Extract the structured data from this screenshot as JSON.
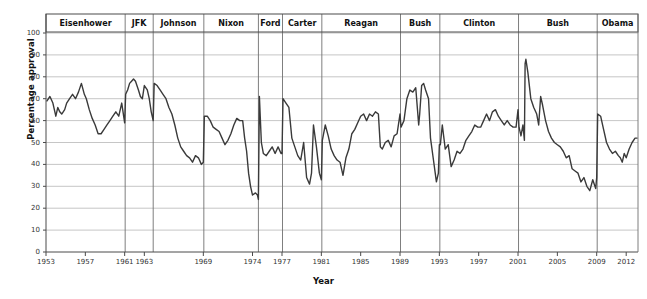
{
  "chart_data": {
    "type": "line",
    "title": "",
    "xlabel": "Year",
    "ylabel": "Percentage approval",
    "xlim": [
      1953,
      2013.2
    ],
    "ylim": [
      0,
      100
    ],
    "grid": true,
    "legend": "none",
    "line_color": "#3a3a3a",
    "grid_color": "#b8b8b8",
    "axis_color": "#555555",
    "yticks": [
      0,
      10,
      20,
      30,
      40,
      50,
      60,
      70,
      80,
      90,
      100
    ],
    "xticks": [
      1953,
      1957,
      1961,
      1963,
      1969,
      1974,
      1977,
      1981,
      1985,
      1989,
      1993,
      1997,
      2001,
      2005,
      2009,
      2012
    ],
    "series": [
      {
        "name": "Presidential approval",
        "x": [
          1953.1,
          1953.4,
          1953.7,
          1954.0,
          1954.2,
          1954.4,
          1954.6,
          1954.9,
          1955.1,
          1955.4,
          1955.7,
          1956.0,
          1956.3,
          1956.6,
          1956.9,
          1957.1,
          1957.4,
          1957.7,
          1958.0,
          1958.3,
          1958.6,
          1958.9,
          1959.2,
          1959.5,
          1959.8,
          1960.1,
          1960.4,
          1960.7,
          1961.0,
          1961.1,
          1961.3,
          1961.5,
          1961.7,
          1961.9,
          1962.1,
          1962.4,
          1962.6,
          1962.8,
          1963.0,
          1963.3,
          1963.5,
          1963.7,
          1963.9,
          1964.0,
          1964.3,
          1964.6,
          1964.9,
          1965.2,
          1965.5,
          1965.8,
          1966.1,
          1966.4,
          1966.7,
          1967.0,
          1967.3,
          1967.6,
          1967.9,
          1968.2,
          1968.5,
          1968.8,
          1969.0,
          1969.1,
          1969.4,
          1969.7,
          1970.0,
          1970.3,
          1970.6,
          1970.9,
          1971.2,
          1971.5,
          1971.8,
          1972.1,
          1972.4,
          1972.7,
          1973.0,
          1973.2,
          1973.4,
          1973.6,
          1973.8,
          1974.0,
          1974.3,
          1974.5,
          1974.6,
          1974.7,
          1974.9,
          1975.1,
          1975.4,
          1975.7,
          1976.0,
          1976.3,
          1976.6,
          1976.9,
          1977.0,
          1977.1,
          1977.4,
          1977.7,
          1978.0,
          1978.3,
          1978.6,
          1978.9,
          1979.2,
          1979.5,
          1979.8,
          1980.0,
          1980.2,
          1980.5,
          1980.8,
          1981.0,
          1981.1,
          1981.4,
          1981.7,
          1982.0,
          1982.3,
          1982.6,
          1982.9,
          1983.2,
          1983.5,
          1983.8,
          1984.1,
          1984.4,
          1984.7,
          1985.0,
          1985.3,
          1985.6,
          1985.9,
          1986.2,
          1986.5,
          1986.8,
          1987.0,
          1987.2,
          1987.5,
          1987.8,
          1988.1,
          1988.4,
          1988.7,
          1989.0,
          1989.1,
          1989.4,
          1989.7,
          1990.0,
          1990.3,
          1990.6,
          1990.9,
          1991.0,
          1991.2,
          1991.4,
          1991.6,
          1991.9,
          1992.1,
          1992.4,
          1992.7,
          1992.9,
          1993.0,
          1993.1,
          1993.3,
          1993.6,
          1993.9,
          1994.2,
          1994.5,
          1994.8,
          1995.1,
          1995.4,
          1995.7,
          1996.0,
          1996.3,
          1996.6,
          1996.9,
          1997.2,
          1997.5,
          1997.8,
          1998.1,
          1998.4,
          1998.7,
          1999.0,
          1999.3,
          1999.6,
          1999.9,
          2000.2,
          2000.5,
          2000.8,
          2001.0,
          2001.1,
          2001.3,
          2001.5,
          2001.65,
          2001.72,
          2001.8,
          2002.0,
          2002.3,
          2002.6,
          2002.9,
          2003.1,
          2003.3,
          2003.5,
          2003.8,
          2004.1,
          2004.4,
          2004.7,
          2005.0,
          2005.3,
          2005.6,
          2005.9,
          2006.2,
          2006.5,
          2006.8,
          2007.1,
          2007.4,
          2007.7,
          2008.0,
          2008.3,
          2008.6,
          2008.9,
          2009.0,
          2009.1,
          2009.4,
          2009.7,
          2010.0,
          2010.3,
          2010.6,
          2010.9,
          2011.2,
          2011.4,
          2011.6,
          2011.8,
          2012.0,
          2012.3,
          2012.6,
          2012.9,
          2013.1
        ],
        "values": [
          69,
          71,
          68,
          62,
          66,
          64,
          63,
          65,
          68,
          70,
          72,
          70,
          73,
          77,
          72,
          70,
          65,
          61,
          58,
          54,
          54,
          56,
          58,
          60,
          62,
          64,
          62,
          68,
          59,
          72,
          74,
          77,
          78,
          79,
          78,
          74,
          71,
          70,
          76,
          74,
          70,
          64,
          60,
          77,
          76,
          74,
          72,
          70,
          66,
          63,
          58,
          52,
          48,
          46,
          44,
          43,
          41,
          44,
          43,
          40,
          41,
          62,
          62,
          60,
          57,
          56,
          55,
          52,
          49,
          51,
          54,
          58,
          61,
          60,
          60,
          52,
          46,
          36,
          30,
          26,
          27,
          26,
          24,
          71,
          50,
          45,
          44,
          46,
          48,
          45,
          48,
          45,
          45,
          70,
          68,
          66,
          52,
          48,
          44,
          42,
          50,
          34,
          31,
          36,
          58,
          48,
          36,
          33,
          51,
          58,
          53,
          47,
          44,
          42,
          41,
          35,
          43,
          47,
          54,
          56,
          59,
          62,
          63,
          60,
          63,
          62,
          64,
          63,
          48,
          47,
          50,
          51,
          48,
          53,
          54,
          63,
          57,
          60,
          70,
          74,
          73,
          75,
          58,
          63,
          76,
          77,
          74,
          70,
          52,
          42,
          32,
          36,
          49,
          49,
          58,
          47,
          49,
          39,
          42,
          46,
          45,
          47,
          51,
          53,
          55,
          58,
          57,
          57,
          60,
          63,
          60,
          64,
          65,
          62,
          60,
          58,
          60,
          58,
          57,
          57,
          65,
          57,
          53,
          58,
          51,
          86,
          88,
          82,
          70,
          66,
          63,
          58,
          71,
          67,
          60,
          55,
          52,
          50,
          49,
          48,
          46,
          43,
          44,
          38,
          37,
          36,
          32,
          34,
          30,
          28,
          33,
          29,
          34,
          63,
          62,
          56,
          50,
          47,
          45,
          46,
          44,
          43,
          41,
          45,
          43,
          47,
          50,
          52,
          52
        ]
      }
    ],
    "presidents": [
      {
        "name": "Eisenhower",
        "start": 1953.0,
        "end": 1961.05
      },
      {
        "name": "JFK",
        "start": 1961.05,
        "end": 1963.9
      },
      {
        "name": "Johnson",
        "start": 1963.9,
        "end": 1969.05
      },
      {
        "name": "Nixon",
        "start": 1969.05,
        "end": 1974.6
      },
      {
        "name": "Ford",
        "start": 1974.6,
        "end": 1977.05
      },
      {
        "name": "Carter",
        "start": 1977.05,
        "end": 1981.05
      },
      {
        "name": "Reagan",
        "start": 1981.05,
        "end": 1989.05
      },
      {
        "name": "Bush",
        "start": 1989.05,
        "end": 1993.05
      },
      {
        "name": "Clinton",
        "start": 1993.05,
        "end": 2001.05
      },
      {
        "name": "Bush",
        "start": 2001.05,
        "end": 2009.05
      },
      {
        "name": "Obama",
        "start": 2009.05,
        "end": 2013.2
      }
    ]
  }
}
